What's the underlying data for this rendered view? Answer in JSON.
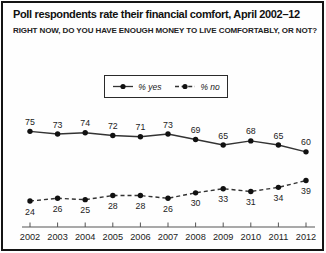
{
  "header": {
    "title": "Poll respondents rate their financial comfort, April 2002–12",
    "subtitle": "RIGHT NOW, DO YOU HAVE ENOUGH MONEY TO LIVE COMFORTABLY, OR NOT?"
  },
  "legend": {
    "items": [
      {
        "label": "% yes",
        "line_style": "solid"
      },
      {
        "label": "% no",
        "line_style": "dashed"
      }
    ]
  },
  "colors": {
    "background": "#fefefe",
    "border": "#141414",
    "line": "#333333",
    "marker": "#111111",
    "axis": "#555555",
    "text": "#1c1c1c"
  },
  "chart_data": {
    "type": "line",
    "title": "Poll respondents rate their financial comfort, April 2002–12",
    "subtitle": "RIGHT NOW, DO YOU HAVE ENOUGH MONEY TO LIVE COMFORTABLY, OR NOT?",
    "categories": [
      "2002",
      "2003",
      "2004",
      "2005",
      "2006",
      "2007",
      "2008",
      "2009",
      "2010",
      "2011",
      "2012"
    ],
    "series": [
      {
        "name": "% yes",
        "style": "solid",
        "label_position": "above",
        "values": [
          75,
          73,
          74,
          72,
          71,
          73,
          69,
          65,
          68,
          65,
          60
        ]
      },
      {
        "name": "% no",
        "style": "dashed",
        "label_position": "below",
        "values": [
          24,
          26,
          25,
          28,
          28,
          26,
          30,
          33,
          31,
          34,
          39
        ]
      }
    ],
    "xlabel": "",
    "ylabel": "",
    "ylim": [
      5,
      95
    ],
    "grid": false,
    "value_labels": true,
    "legend_position": "top-center"
  }
}
